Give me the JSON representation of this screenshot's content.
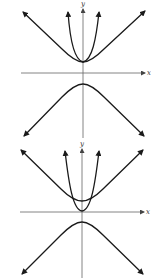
{
  "figures": [
    {
      "id": "top",
      "description": "Hyperbola branches with parabola sharing vertex of upper branch",
      "x_axis_label": "x",
      "y_axis_label": "y"
    },
    {
      "id": "bottom",
      "description": "Hyperbola branches with parabola whose vertex lies below upper hyperbola vertex",
      "x_axis_label": "x",
      "y_axis_label": "y"
    }
  ],
  "colors": {
    "curve": "#1a1a1a",
    "axis": "#555555",
    "background": "#ffffff"
  }
}
